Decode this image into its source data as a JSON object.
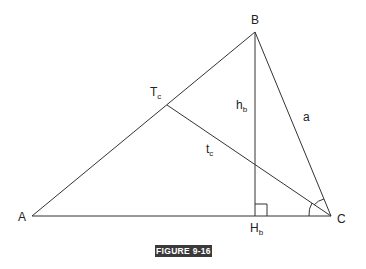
{
  "figure": {
    "caption": "FIGURE 9-16",
    "line_color": "#333333",
    "caption_bg": "#3a3a3a",
    "vertices": {
      "A": {
        "label": "A",
        "x": 32,
        "y": 216
      },
      "B": {
        "label": "B",
        "x": 255,
        "y": 32
      },
      "C": {
        "label": "C",
        "x": 331,
        "y": 216
      },
      "Tc": {
        "label": "T",
        "sub": "c",
        "x": 167,
        "y": 105
      },
      "Hb": {
        "label": "H",
        "sub": "b",
        "x": 255,
        "y": 216
      }
    },
    "segment_labels": {
      "hb": {
        "label": "h",
        "sub": "b"
      },
      "tc": {
        "label": "t",
        "sub": "c"
      },
      "a": {
        "label": "a"
      }
    },
    "markers": [
      "right-angle at Hb",
      "angle arcs at C (bisected)"
    ]
  }
}
